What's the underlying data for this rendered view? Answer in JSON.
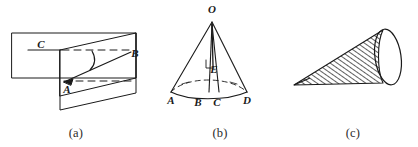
{
  "canvas": {
    "width": 418,
    "height": 147,
    "background": "#ffffff",
    "ink": "#1a1a1a"
  },
  "figures": [
    {
      "id": "figure-a",
      "caption": "(a)",
      "description": "two intersecting planes: a horizontal rectangular plane and a slanted parallelogram plane with a dihedral angle arc",
      "labels": [
        {
          "name": "point-label-c",
          "text": "C",
          "x": 41,
          "y": 48
        },
        {
          "name": "point-label-b",
          "text": "B",
          "x": 133,
          "y": 57
        },
        {
          "name": "point-label-a",
          "text": "A",
          "x": 66,
          "y": 92
        }
      ]
    },
    {
      "id": "figure-b",
      "caption": "(b)",
      "description": "a cone/pyramid with apex O, interior point E, and base points A, B, C, D",
      "labels": [
        {
          "name": "point-label-o",
          "text": "O",
          "x": 212,
          "y": 12
        },
        {
          "name": "point-label-e",
          "text": "E",
          "x": 213,
          "y": 71
        },
        {
          "name": "point-label-a",
          "text": "A",
          "x": 171,
          "y": 99
        },
        {
          "name": "point-label-b",
          "text": "B",
          "x": 197,
          "y": 101
        },
        {
          "name": "point-label-c",
          "text": "C",
          "x": 216,
          "y": 101
        },
        {
          "name": "point-label-d",
          "text": "D",
          "x": 246,
          "y": 99
        }
      ]
    },
    {
      "id": "figure-c",
      "caption": "(c)",
      "description": "a long hatched cone lying on its side with an elliptical base at the right",
      "labels": []
    }
  ],
  "captions": {
    "a": "(a)",
    "b": "(b)",
    "c": "(c)"
  }
}
